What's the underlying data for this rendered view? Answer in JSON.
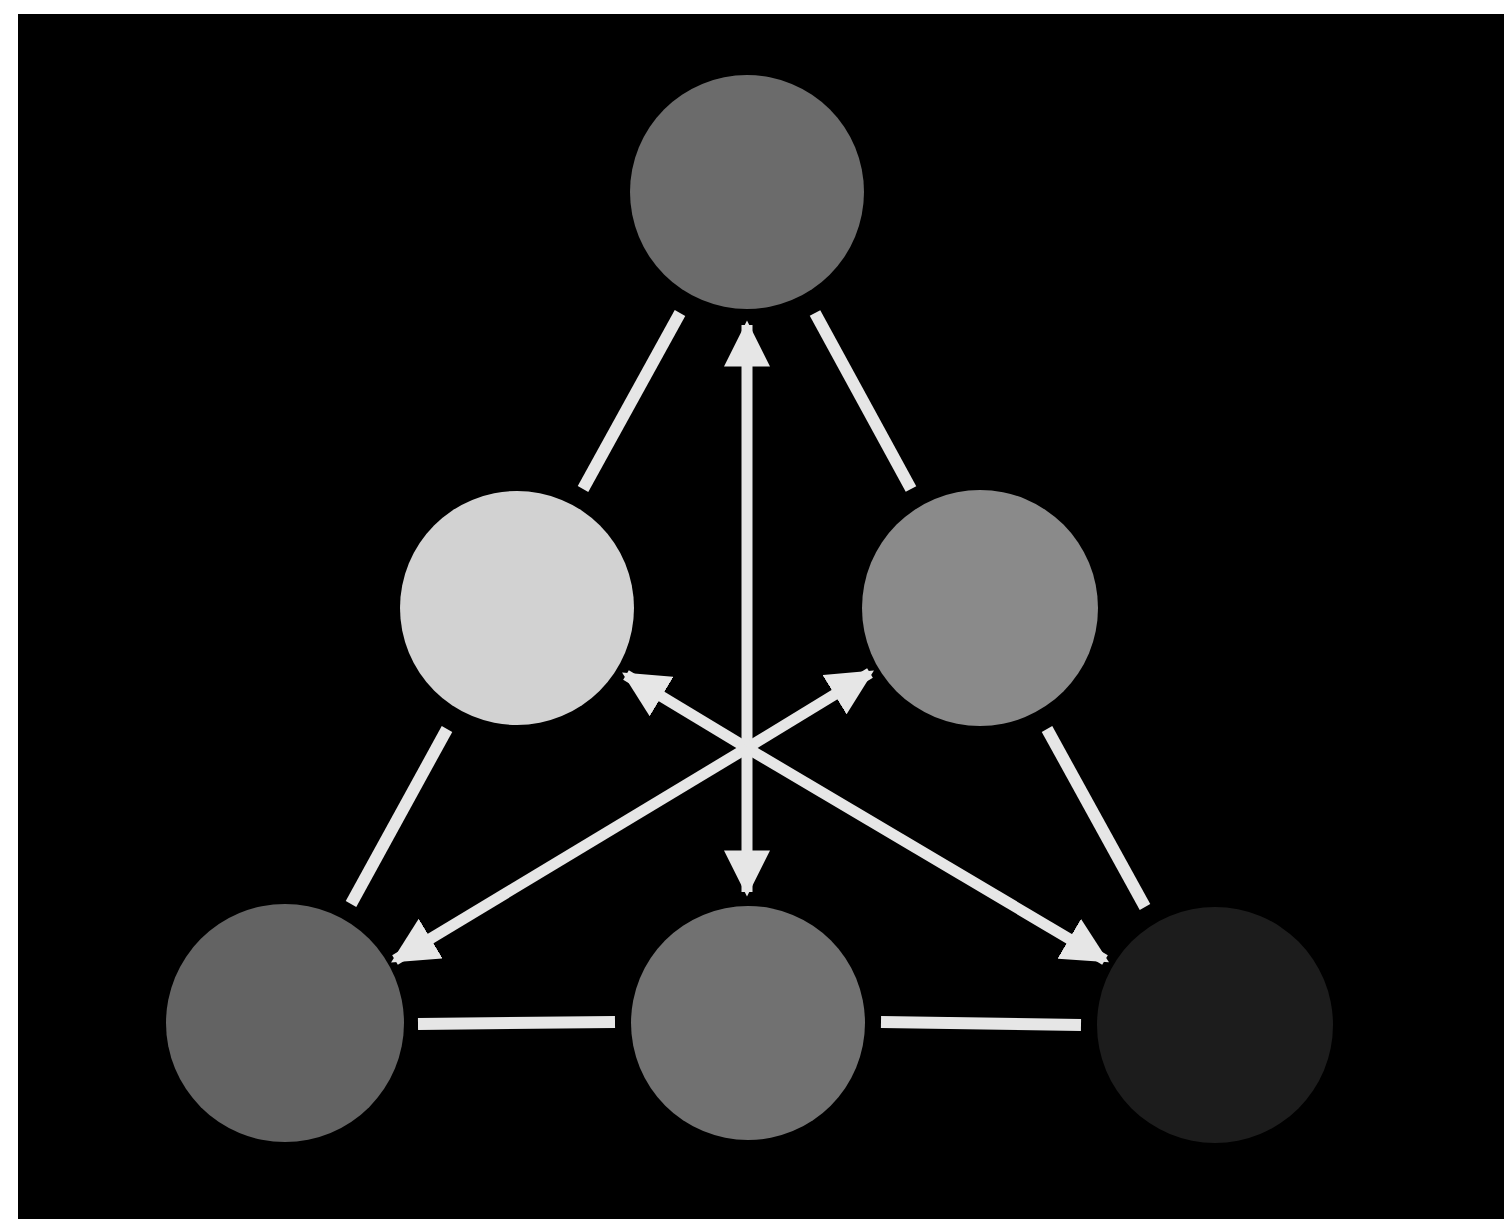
{
  "diagram": {
    "background": "#000000",
    "page_background": "#ffffff",
    "connector_color": "#e6e6e6",
    "nodes": [
      {
        "id": "top",
        "cx": 747,
        "cy": 192,
        "r": 117,
        "fill": "#6b6b6b"
      },
      {
        "id": "mid-left",
        "cx": 517,
        "cy": 608,
        "r": 117,
        "fill": "#d2d2d2"
      },
      {
        "id": "mid-right",
        "cx": 980,
        "cy": 608,
        "r": 118,
        "fill": "#8a8a8a"
      },
      {
        "id": "bottom-left",
        "cx": 285,
        "cy": 1023,
        "r": 119,
        "fill": "#636363"
      },
      {
        "id": "bottom-center",
        "cx": 748,
        "cy": 1023,
        "r": 117,
        "fill": "#717171"
      },
      {
        "id": "bottom-right",
        "cx": 1215,
        "cy": 1025,
        "r": 118,
        "fill": "#1c1c1c"
      }
    ],
    "edges": [
      {
        "id": "top-to-mid-left",
        "x1": 680,
        "y1": 313,
        "x2": 583,
        "y2": 489
      },
      {
        "id": "top-to-mid-right",
        "x1": 815,
        "y1": 313,
        "x2": 911,
        "y2": 489
      },
      {
        "id": "mid-left-to-bottom-left",
        "x1": 447,
        "y1": 729,
        "x2": 351,
        "y2": 904
      },
      {
        "id": "mid-right-to-bottom-right",
        "x1": 1047,
        "y1": 729,
        "x2": 1145,
        "y2": 907
      },
      {
        "id": "bottom-left-to-bottom-center",
        "x1": 418,
        "y1": 1024,
        "x2": 615,
        "y2": 1022
      },
      {
        "id": "bottom-center-to-bottom-right",
        "x1": 881,
        "y1": 1022,
        "x2": 1081,
        "y2": 1025
      }
    ],
    "arrows": [
      {
        "id": "vertical-double-arrow",
        "x1": 747,
        "y1": 325,
        "x2": 747,
        "y2": 892,
        "double": true
      },
      {
        "id": "diag-arrow-to-mid-left",
        "x1": 747,
        "y1": 748,
        "x2": 626,
        "y2": 675,
        "double": false
      },
      {
        "id": "diag-arrow-to-mid-right",
        "x1": 747,
        "y1": 748,
        "x2": 870,
        "y2": 673,
        "double": false
      },
      {
        "id": "diag-arrow-to-bottom-left",
        "x1": 747,
        "y1": 748,
        "x2": 395,
        "y2": 960,
        "double": false
      },
      {
        "id": "diag-arrow-to-bottom-right",
        "x1": 747,
        "y1": 748,
        "x2": 1105,
        "y2": 960,
        "double": false
      }
    ]
  }
}
